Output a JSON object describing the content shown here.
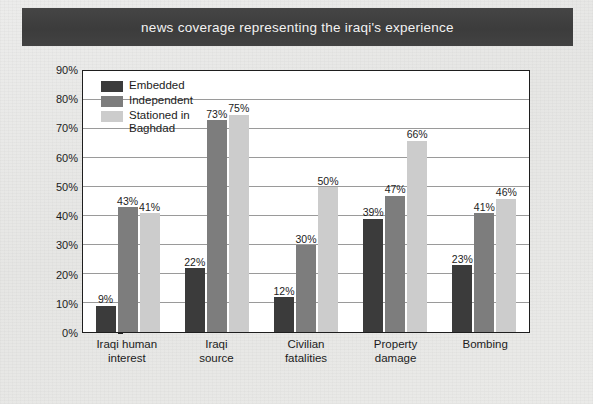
{
  "banner": {
    "title": "news coverage representing the iraqi's experience"
  },
  "colors": {
    "banner_bg": "#3f3f3f",
    "banner_text": "#f2f2f2",
    "page_bg": "#e9e9e7",
    "plot_bg": "#ffffff",
    "plot_border": "#1e1e1e",
    "gridline": "#9a9a9a",
    "embedded": "#3b3b3b",
    "independent": "#7d7d7d",
    "stationed": "#cccccc"
  },
  "legend": {
    "items": [
      {
        "label": "Embedded",
        "color": "#3b3b3b"
      },
      {
        "label": "Independent",
        "color": "#7d7d7d"
      },
      {
        "label": "Stationed in\nBaghdad",
        "color": "#cccccc"
      }
    ]
  },
  "chart_data": {
    "type": "bar",
    "title": "news coverage representing the iraqi's experience",
    "xlabel": "",
    "ylabel": "",
    "ylim": [
      0,
      90
    ],
    "ytick_step": 10,
    "ytick_labels": [
      "0%",
      "10%",
      "20%",
      "30%",
      "40%",
      "50%",
      "60%",
      "70%",
      "80%",
      "90%"
    ],
    "ytick_values": [
      0,
      10,
      20,
      30,
      40,
      50,
      60,
      70,
      80,
      90
    ],
    "grid": "horizontal",
    "legend_position": "inside-top-left",
    "value_labels": true,
    "value_label_suffix": "%",
    "categories": [
      "Iraqi human\ninterest",
      "Iraqi\nsource",
      "Civilian\nfatalities",
      "Property\ndamage",
      "Bombing"
    ],
    "series": [
      {
        "name": "Embedded",
        "color": "#3b3b3b",
        "values": [
          9,
          22,
          12,
          39,
          23
        ]
      },
      {
        "name": "Independent",
        "color": "#7d7d7d",
        "values": [
          43,
          73,
          30,
          47,
          41
        ]
      },
      {
        "name": "Stationed in Baghdad",
        "color": "#cccccc",
        "values": [
          41,
          75,
          50,
          66,
          46
        ]
      }
    ]
  }
}
